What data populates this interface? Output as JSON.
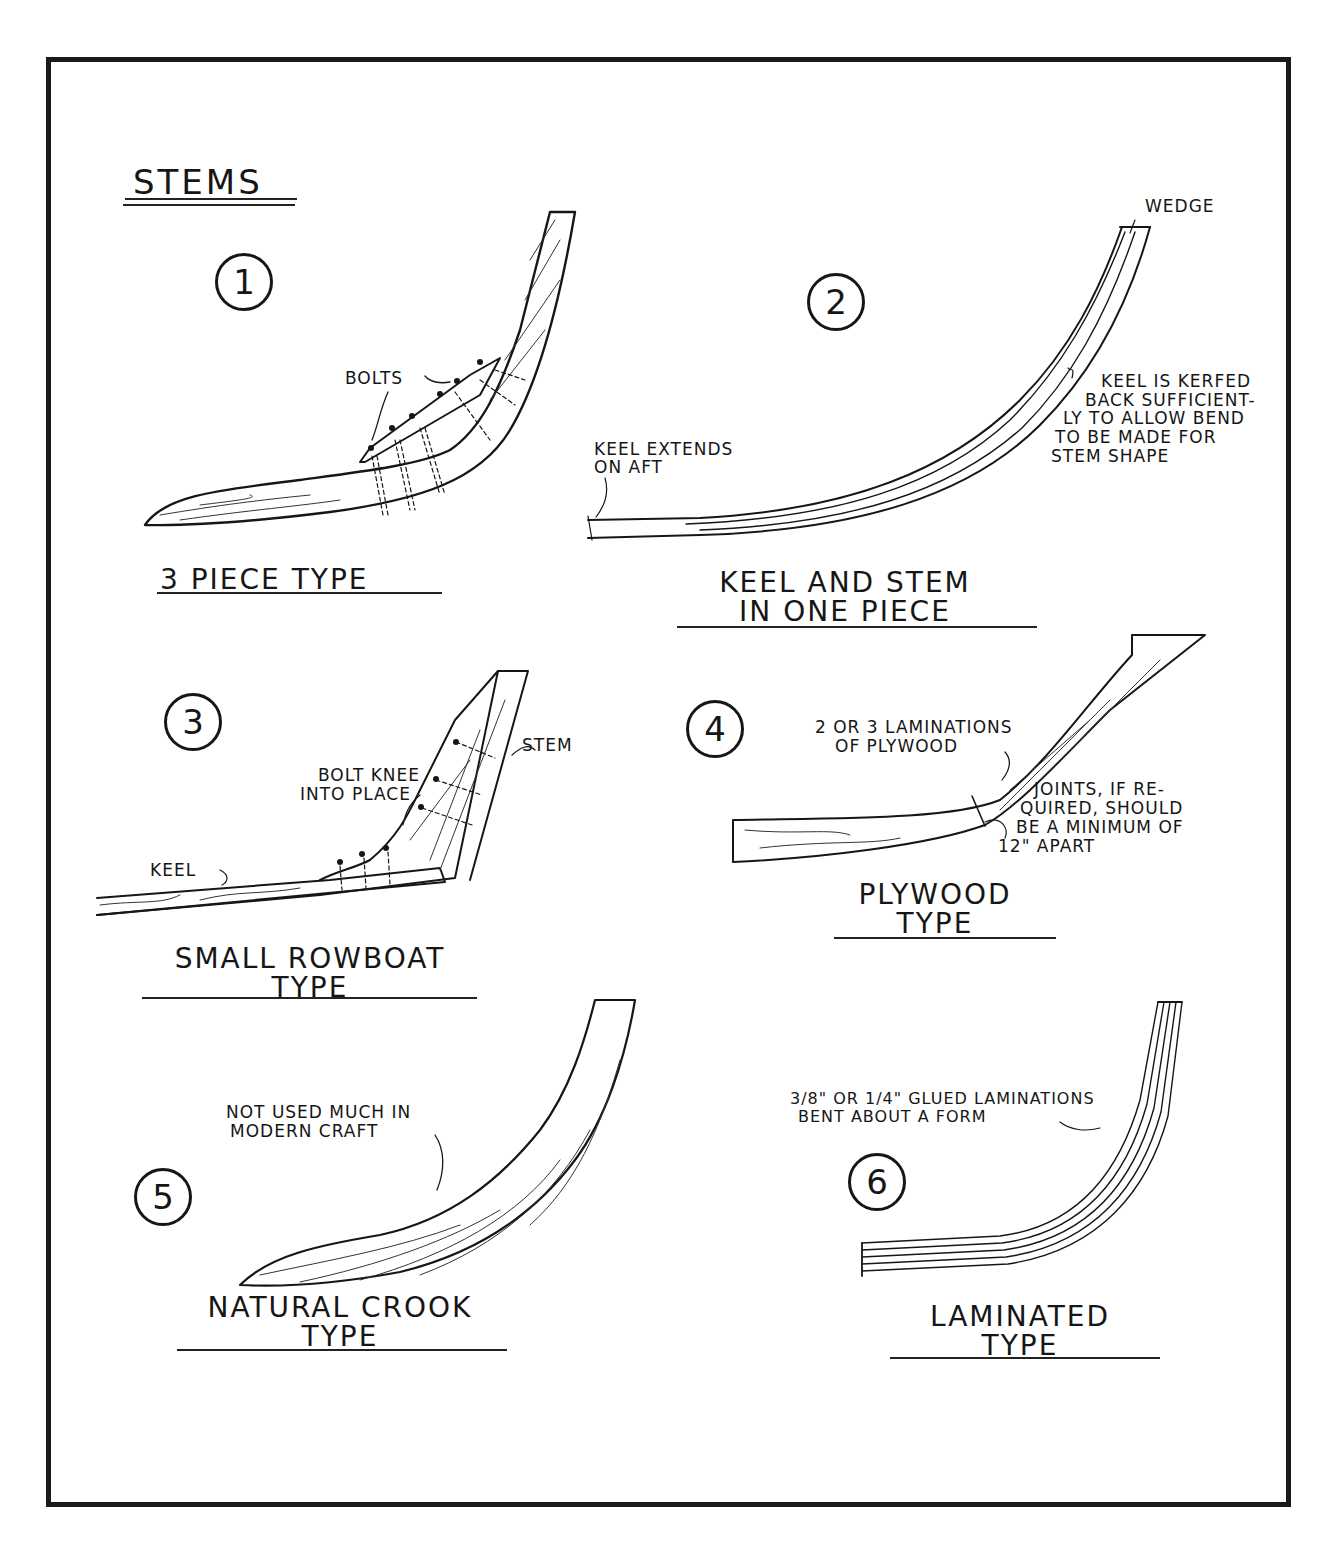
{
  "title": "STEMS",
  "figures": [
    {
      "number": "1",
      "caption": [
        "3 PIECE TYPE"
      ],
      "annotations": [
        "BOLTS"
      ]
    },
    {
      "number": "2",
      "caption": [
        "KEEL AND STEM",
        "IN ONE PIECE"
      ],
      "annotations": [
        "WEDGE",
        "KEEL EXTENDS",
        "ON AFT",
        "KEEL IS KERFED",
        "BACK SUFFICIENT-",
        "LY TO ALLOW BEND",
        "TO BE MADE FOR",
        "STEM SHAPE"
      ]
    },
    {
      "number": "3",
      "caption": [
        "SMALL ROWBOAT",
        "TYPE"
      ],
      "annotations": [
        "STEM",
        "BOLT KNEE",
        "INTO PLACE",
        "KEEL"
      ]
    },
    {
      "number": "4",
      "caption": [
        "PLYWOOD",
        "TYPE"
      ],
      "annotations": [
        "2 OR 3 LAMINATIONS",
        "OF PLYWOOD",
        "JOINTS, IF RE-",
        "QUIRED, SHOULD",
        "BE A MINIMUM OF",
        "12\" APART"
      ]
    },
    {
      "number": "5",
      "caption": [
        "NATURAL CROOK",
        "TYPE"
      ],
      "annotations": [
        "NOT USED MUCH IN",
        "MODERN CRAFT"
      ]
    },
    {
      "number": "6",
      "caption": [
        "LAMINATED",
        "TYPE"
      ],
      "annotations": [
        "3/8\" OR 1/4\" GLUED LAMINATIONS",
        "BENT ABOUT A FORM"
      ]
    }
  ]
}
